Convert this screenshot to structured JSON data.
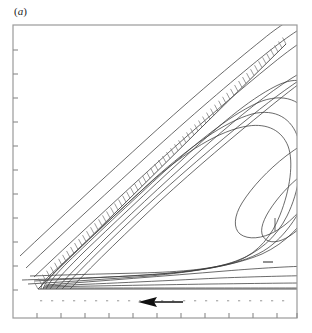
{
  "figure": {
    "panel_label": "(a)",
    "panel_label_open": "(",
    "panel_label_letter": "a",
    "panel_label_close": ")"
  },
  "colors": {
    "frame": "#9a9a9a",
    "tick": "#8a8a8a",
    "contour": "#3a3a3a",
    "hatch": "#6f6f6f",
    "wall": "#555555",
    "arrow": "#101010",
    "dots": "#b4b4b4",
    "background": "#ffffff",
    "label": "#222222"
  },
  "axes": {
    "frame": {
      "x": 13,
      "y": 25,
      "width": 284,
      "height": 293
    },
    "left_tick_count": 11,
    "bottom_tick_count": 12,
    "tick_length": 5,
    "left_ticks_y": [
      50,
      74,
      98,
      122,
      146,
      170,
      194,
      218,
      242,
      266,
      290
    ],
    "bottom_ticks_x": [
      37,
      61,
      85,
      109,
      133,
      157,
      181,
      205,
      229,
      253,
      277,
      297
    ],
    "tick_labels": [],
    "xlabel": "",
    "ylabel": ""
  },
  "chart_data": {
    "type": "line",
    "title": "(a)",
    "xlabel": "",
    "ylabel": "",
    "xlim": [
      0,
      1
    ],
    "ylim": [
      0,
      1
    ],
    "grid": false,
    "legend": null,
    "annotations": [
      {
        "name": "flow-direction-arrow",
        "kind": "arrow",
        "direction": "left",
        "x_start": 183,
        "x_end": 140,
        "y": 302
      },
      {
        "name": "vortex-center-marker",
        "kind": "tick",
        "x": 275,
        "y": 224
      }
    ],
    "wall": {
      "name": "inclined-hatched-wall",
      "x1": 38,
      "y1": 289,
      "x2": 286,
      "y2": 44,
      "hatch_side": "upper-left",
      "hatch_count": 62,
      "hatch_length": 7
    },
    "bottom_wall": {
      "name": "horizontal-wall",
      "x1": 38,
      "y1": 289,
      "x2": 297,
      "y2": 289
    },
    "series": [
      {
        "name": "streamline-1",
        "values": []
      },
      {
        "name": "streamline-2",
        "values": []
      },
      {
        "name": "streamline-3",
        "values": []
      },
      {
        "name": "streamline-4",
        "values": []
      },
      {
        "name": "streamline-5",
        "values": []
      },
      {
        "name": "streamline-6",
        "values": []
      },
      {
        "name": "streamline-7",
        "values": []
      },
      {
        "name": "streamline-8",
        "values": []
      },
      {
        "name": "streamline-9",
        "values": []
      },
      {
        "name": "streamline-10",
        "values": []
      },
      {
        "name": "streamline-11",
        "values": []
      },
      {
        "name": "streamline-12",
        "values": []
      }
    ]
  }
}
